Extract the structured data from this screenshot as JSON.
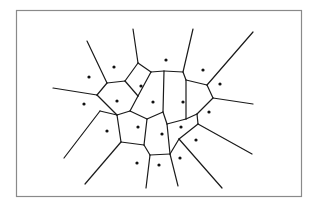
{
  "diagram": {
    "type": "voronoi",
    "title": "",
    "colors": {
      "edge": "#1a1a1a",
      "site": "#111111",
      "frame": "#8a8a8a",
      "background": "#ffffff"
    },
    "sites": [
      [
        89,
        77
      ],
      [
        114,
        67
      ],
      [
        84,
        104
      ],
      [
        117,
        101
      ],
      [
        107,
        131
      ],
      [
        141,
        86
      ],
      [
        153,
        102
      ],
      [
        138,
        127
      ],
      [
        166,
        60
      ],
      [
        183,
        102
      ],
      [
        162,
        134
      ],
      [
        203,
        70
      ],
      [
        220,
        84
      ],
      [
        209,
        112
      ],
      [
        196,
        140
      ],
      [
        180,
        158
      ],
      [
        159,
        165
      ],
      [
        137,
        163
      ],
      [
        181,
        127
      ]
    ],
    "edges": [
      [
        [
          87,
          41
        ],
        [
          107,
          83
        ]
      ],
      [
        [
          53,
          88
        ],
        [
          97,
          95
        ]
      ],
      [
        [
          97,
          95
        ],
        [
          107,
          83
        ]
      ],
      [
        [
          107,
          83
        ],
        [
          125,
          81
        ]
      ],
      [
        [
          125,
          81
        ],
        [
          138,
          63
        ]
      ],
      [
        [
          138,
          63
        ],
        [
          133,
          29
        ]
      ],
      [
        [
          138,
          63
        ],
        [
          151,
          72
        ]
      ],
      [
        [
          151,
          72
        ],
        [
          164,
          71
        ]
      ],
      [
        [
          164,
          71
        ],
        [
          183,
          72
        ]
      ],
      [
        [
          183,
          72
        ],
        [
          193,
          29
        ]
      ],
      [
        [
          183,
          72
        ],
        [
          186,
          80
        ]
      ],
      [
        [
          186,
          80
        ],
        [
          207,
          85
        ]
      ],
      [
        [
          207,
          85
        ],
        [
          253,
          32
        ]
      ],
      [
        [
          207,
          85
        ],
        [
          213,
          98
        ]
      ],
      [
        [
          213,
          98
        ],
        [
          253,
          104
        ]
      ],
      [
        [
          213,
          98
        ],
        [
          197,
          114
        ]
      ],
      [
        [
          197,
          114
        ],
        [
          198,
          124
        ]
      ],
      [
        [
          198,
          124
        ],
        [
          252,
          154
        ]
      ],
      [
        [
          198,
          124
        ],
        [
          179,
          139
        ]
      ],
      [
        [
          179,
          139
        ],
        [
          222,
          188
        ]
      ],
      [
        [
          179,
          139
        ],
        [
          170,
          154
        ]
      ],
      [
        [
          170,
          154
        ],
        [
          178,
          186
        ]
      ],
      [
        [
          170,
          154
        ],
        [
          150,
          155
        ]
      ],
      [
        [
          150,
          155
        ],
        [
          144,
          145
        ]
      ],
      [
        [
          144,
          145
        ],
        [
          121,
          142
        ]
      ],
      [
        [
          121,
          142
        ],
        [
          85,
          184
        ]
      ],
      [
        [
          121,
          142
        ],
        [
          117,
          115
        ]
      ],
      [
        [
          117,
          115
        ],
        [
          97,
          95
        ]
      ],
      [
        [
          117,
          115
        ],
        [
          100,
          111
        ]
      ],
      [
        [
          100,
          111
        ],
        [
          64,
          158
        ]
      ],
      [
        [
          125,
          81
        ],
        [
          138,
          96
        ]
      ],
      [
        [
          138,
          96
        ],
        [
          151,
          72
        ]
      ],
      [
        [
          138,
          96
        ],
        [
          130,
          111
        ]
      ],
      [
        [
          130,
          111
        ],
        [
          117,
          115
        ]
      ],
      [
        [
          130,
          111
        ],
        [
          147,
          119
        ]
      ],
      [
        [
          147,
          119
        ],
        [
          144,
          145
        ]
      ],
      [
        [
          147,
          119
        ],
        [
          163,
          112
        ]
      ],
      [
        [
          163,
          112
        ],
        [
          164,
          71
        ]
      ],
      [
        [
          163,
          112
        ],
        [
          167,
          124
        ]
      ],
      [
        [
          167,
          124
        ],
        [
          170,
          154
        ]
      ],
      [
        [
          167,
          124
        ],
        [
          186,
          119
        ]
      ],
      [
        [
          186,
          119
        ],
        [
          197,
          114
        ]
      ],
      [
        [
          186,
          119
        ],
        [
          186,
          80
        ]
      ],
      [
        [
          150,
          155
        ],
        [
          146,
          188
        ]
      ]
    ]
  }
}
